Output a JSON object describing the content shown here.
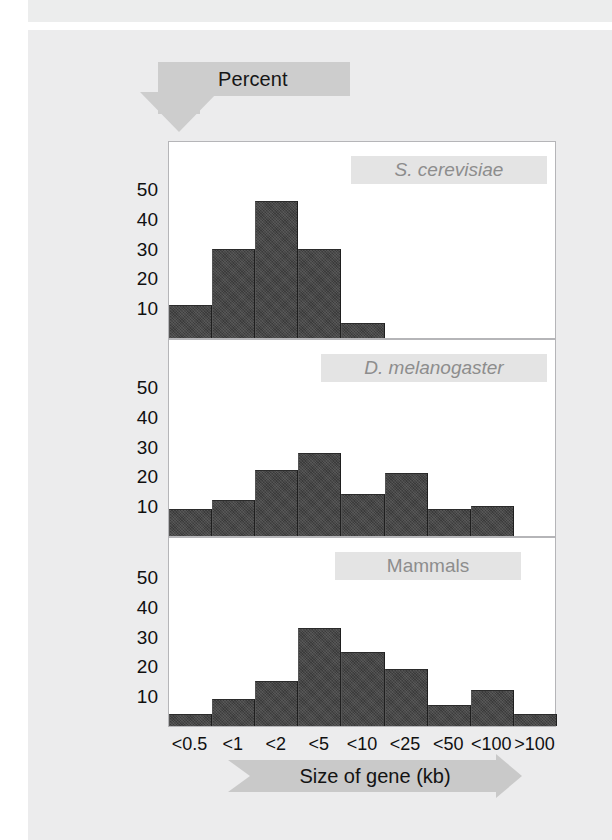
{
  "figure": {
    "y_axis_banner_label": "Percent",
    "x_axis_banner_label": "Size of gene (kb)"
  },
  "chart_data": {
    "type": "bar",
    "title": "",
    "subtitle": "",
    "xlabel": "Size of gene (kb)",
    "ylabel": "Percent",
    "categories": [
      "<0.5",
      "<1",
      "<2",
      "<5",
      "<10",
      "<25",
      "<50",
      "<100",
      ">100"
    ],
    "ylim": [
      0,
      58
    ],
    "yticks": [
      10,
      20,
      30,
      40,
      50
    ],
    "grid": false,
    "legend": "none",
    "bar_color": "#3b3b3b",
    "panel_background": "#ffffff",
    "page_background": "#ececed",
    "banner_color": "#cdcdcd",
    "caption_band_color": "#e4e4e4",
    "caption_text_color": "#8d8d8d",
    "panels": [
      {
        "name": "S. cerevisiae",
        "italic": true,
        "values": [
          11,
          30,
          46,
          30,
          5,
          0,
          0,
          0,
          0
        ]
      },
      {
        "name": "D. melanogaster",
        "italic": true,
        "values": [
          9,
          12,
          22,
          28,
          14,
          21,
          9,
          10,
          0
        ]
      },
      {
        "name": "Mammals",
        "italic": false,
        "values": [
          4,
          9,
          15,
          33,
          25,
          19,
          7,
          12,
          4
        ]
      }
    ]
  }
}
